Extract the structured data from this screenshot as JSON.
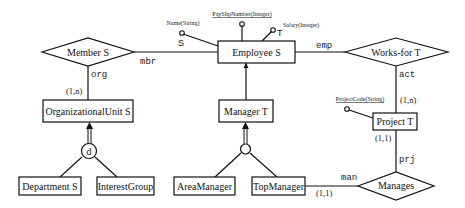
{
  "diagram": {
    "type": "ER schema",
    "entities": [
      {
        "id": "employee",
        "label": "Employee S"
      },
      {
        "id": "orgunit",
        "label": "OrganizationalUnit S"
      },
      {
        "id": "manager",
        "label": "Manager T"
      },
      {
        "id": "project",
        "label": "Project T"
      },
      {
        "id": "department",
        "label": "Department S"
      },
      {
        "id": "interestgroup",
        "label": "InterestGroup"
      },
      {
        "id": "areamanager",
        "label": "AreaManager"
      },
      {
        "id": "topmanager",
        "label": "TopManager"
      }
    ],
    "relationships": [
      {
        "id": "member",
        "label": "Member S"
      },
      {
        "id": "worksfor",
        "label": "Works-for T"
      },
      {
        "id": "manages",
        "label": "Manages"
      }
    ],
    "attributes": {
      "name": {
        "label": "Name(String)",
        "tag": "S"
      },
      "payslip": {
        "label": "PaySlipNumber(Integer)"
      },
      "salary": {
        "label": "Salary(Integer)",
        "tag": "T"
      },
      "projectcode": {
        "label": "ProjectCode(String)"
      }
    },
    "roles": {
      "mbr": "mbr",
      "org": "org",
      "emp": "emp",
      "act": "act",
      "prj": "prj",
      "man": "man"
    },
    "cardinalities": {
      "org_member": "(1,n)",
      "project_worksfor": "(1,n)",
      "project_manages": "(1,1)",
      "topmanager_manages": "(1,1)"
    },
    "generalizations": {
      "orgunit": {
        "marker": "d"
      },
      "manager": {
        "marker": ""
      }
    }
  }
}
